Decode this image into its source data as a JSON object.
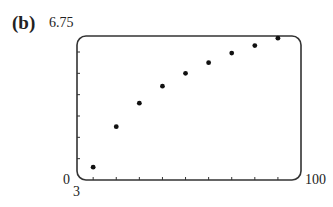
{
  "panel_label": "(b)",
  "axes": {
    "ymax_label": "6.75",
    "ymin_label": "0",
    "xmin_label": "3",
    "xmax_label": "100"
  },
  "chart_data": {
    "type": "scatter",
    "title": "",
    "xlabel": "",
    "ylabel": "",
    "xlim": [
      3,
      100
    ],
    "ylim": [
      0,
      6.75
    ],
    "grid": false,
    "legend": null,
    "x_ticks_every": 10,
    "y_ticks_every": 1,
    "series": [
      {
        "name": "data",
        "x": [
          10,
          20,
          30,
          40,
          50,
          60,
          70,
          80,
          90
        ],
        "y": [
          0.6,
          2.5,
          3.6,
          4.4,
          5.0,
          5.5,
          5.95,
          6.3,
          6.65
        ]
      }
    ],
    "annotations": [
      "(b)"
    ]
  }
}
